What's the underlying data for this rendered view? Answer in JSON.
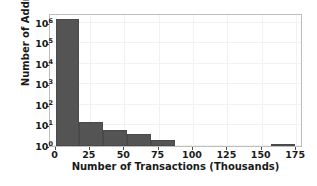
{
  "chart_data": {
    "type": "bar",
    "title": "",
    "xlabel": "Number of Transactions (Thousands)",
    "ylabel": "Number of Addresses",
    "yscale": "log",
    "xlim": [
      -4,
      180
    ],
    "ylim": [
      1,
      3000000
    ],
    "grid": true,
    "legend": null,
    "bar_color": "#545454",
    "bin_edges": [
      0,
      17.4,
      34.8,
      52.2,
      69.6,
      87.0,
      156.6,
      174.0
    ],
    "bars": [
      {
        "x_start": 0.0,
        "x_end": 17.4,
        "value": 1500000
      },
      {
        "x_start": 17.4,
        "x_end": 34.8,
        "value": 14
      },
      {
        "x_start": 34.8,
        "x_end": 52.2,
        "value": 6
      },
      {
        "x_start": 52.2,
        "x_end": 69.6,
        "value": 4
      },
      {
        "x_start": 69.6,
        "x_end": 87.0,
        "value": 2
      },
      {
        "x_start": 156.6,
        "x_end": 174.0,
        "value": 1
      }
    ],
    "xticks": [
      {
        "value": 0,
        "label": "0"
      },
      {
        "value": 25,
        "label": "25"
      },
      {
        "value": 50,
        "label": "50"
      },
      {
        "value": 75,
        "label": "75"
      },
      {
        "value": 100,
        "label": "100"
      },
      {
        "value": 125,
        "label": "125"
      },
      {
        "value": 150,
        "label": "150"
      },
      {
        "value": 175,
        "label": "175"
      }
    ],
    "yticks": [
      {
        "value": 1,
        "mantissa": "10",
        "exponent": "0"
      },
      {
        "value": 10,
        "mantissa": "10",
        "exponent": "1"
      },
      {
        "value": 100,
        "mantissa": "10",
        "exponent": "2"
      },
      {
        "value": 1000,
        "mantissa": "10",
        "exponent": "3"
      },
      {
        "value": 10000,
        "mantissa": "10",
        "exponent": "4"
      },
      {
        "value": 100000,
        "mantissa": "10",
        "exponent": "5"
      },
      {
        "value": 1000000,
        "mantissa": "10",
        "exponent": "6"
      }
    ]
  }
}
